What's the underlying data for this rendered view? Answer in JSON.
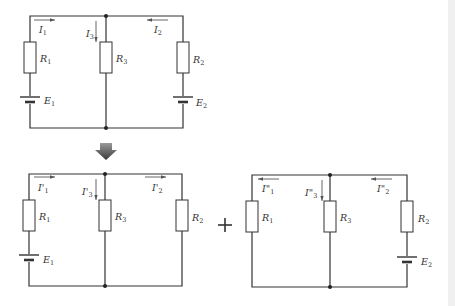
{
  "diagram": {
    "type": "superposition-circuit",
    "colors": {
      "wire": "#333333",
      "arrow_fill": "#555555",
      "background": "#ffffff"
    },
    "original": {
      "currents": [
        {
          "id": "I1",
          "label": "I",
          "sub": "1",
          "direction": "right"
        },
        {
          "id": "I3",
          "label": "I",
          "sub": "3",
          "direction": "down"
        },
        {
          "id": "I2",
          "label": "I",
          "sub": "2",
          "direction": "left"
        }
      ],
      "resistors": [
        {
          "label": "R",
          "sub": "1"
        },
        {
          "label": "R",
          "sub": "3"
        },
        {
          "label": "R",
          "sub": "2"
        }
      ],
      "sources": [
        {
          "label": "E",
          "sub": "1"
        },
        {
          "label": "E",
          "sub": "2"
        }
      ]
    },
    "transition_arrow": "down-arrow",
    "e1_only": {
      "currents": [
        {
          "id": "I1p",
          "label": "I'",
          "sub": "1",
          "direction": "right"
        },
        {
          "id": "I3p",
          "label": "I'",
          "sub": "3",
          "direction": "down"
        },
        {
          "id": "I2p",
          "label": "I'",
          "sub": "2",
          "direction": "right"
        }
      ],
      "resistors": [
        {
          "label": "R",
          "sub": "1"
        },
        {
          "label": "R",
          "sub": "3"
        },
        {
          "label": "R",
          "sub": "2"
        }
      ],
      "sources": [
        {
          "label": "E",
          "sub": "1"
        }
      ]
    },
    "operator": "+",
    "e2_only": {
      "currents": [
        {
          "id": "I1pp",
          "label": "I\"",
          "sub": "1",
          "direction": "left"
        },
        {
          "id": "I3pp",
          "label": "I\"",
          "sub": "3",
          "direction": "down"
        },
        {
          "id": "I2pp",
          "label": "I\"",
          "sub": "2",
          "direction": "left"
        }
      ],
      "resistors": [
        {
          "label": "R",
          "sub": "1"
        },
        {
          "label": "R",
          "sub": "3"
        },
        {
          "label": "R",
          "sub": "2"
        }
      ],
      "sources": [
        {
          "label": "E",
          "sub": "2"
        }
      ]
    }
  }
}
